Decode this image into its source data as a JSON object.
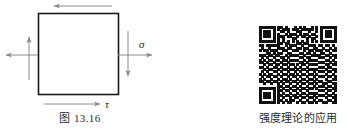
{
  "figure": {
    "caption": "图 13.16",
    "element": {
      "shape": "square",
      "stress_labels": {
        "normal": "σ",
        "shear": "τ"
      },
      "arrows": [
        {
          "name": "top-shear-arrow",
          "direction": "left",
          "edge": "top"
        },
        {
          "name": "bottom-shear-arrow",
          "direction": "right",
          "edge": "bottom",
          "label": "τ"
        },
        {
          "name": "left-shear-arrow",
          "direction": "up",
          "edge": "left"
        },
        {
          "name": "right-shear-arrow",
          "direction": "down",
          "edge": "right"
        },
        {
          "name": "left-normal-arrow",
          "direction": "left",
          "edge": "left"
        },
        {
          "name": "right-normal-arrow",
          "direction": "right",
          "edge": "right",
          "label": "σ"
        }
      ]
    },
    "colors": {
      "outline": "#1a1a1a",
      "arrow": "#888888",
      "text": "#2b2b2b"
    }
  },
  "qr": {
    "caption": "强度理论的应用",
    "alt_name": "qr-code",
    "modules": 33,
    "matrix": [
      "111111101101000101010010101111111",
      "100000101011101110111110101000001",
      "101110100110100011000100101011101",
      "101110101001011101011011001011101",
      "101110101110110010110100101011101",
      "100000101010001100001011001000001",
      "111111101010101010101010101111111",
      "000000001101100011011000000000000",
      "110111111001011100100111011011010",
      "010010001110110011011001100100101",
      "101101110011001110010110111011011",
      "000110101100110001101101001100100",
      "111011011001011110010011110011011",
      "010100100110100001101100011100101",
      "101011011011011110010111100011010",
      "110100100100100001101000011100101",
      "001011011011011010110111100011011",
      "110100110100100101001000011101100",
      "001011001011011010110111100010011",
      "010100110100100101001001011101101",
      "101011001011011010110110100010010",
      "010110110100101101001001011101101",
      "101001001011010010110110100010011",
      "110110110101101101001001011001100",
      "001001001010010010110110100110011",
      "000000001101101101001001011101101",
      "111111101010010010110110100010011",
      "100000101101101101001000011101101",
      "101110101010010010110111100010010",
      "101110101101101101001001011101101",
      "101110101010010110110110100010011",
      "100000101101011001001001011001101",
      "111111101010110010110110100110011"
    ]
  }
}
